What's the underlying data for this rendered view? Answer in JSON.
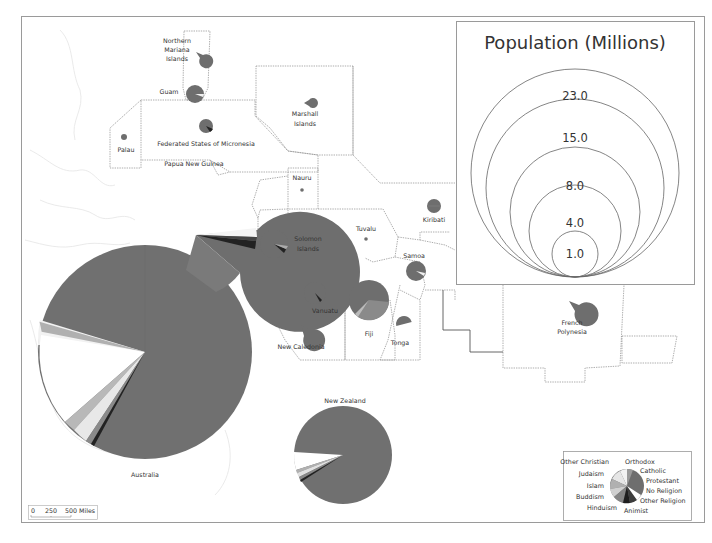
{
  "map": {
    "title": "Population (Millions)",
    "scale_bar": {
      "labels": [
        "0",
        "250",
        "500 Miles"
      ]
    }
  },
  "size_legend": {
    "title": "Population (Millions)",
    "values": [
      "23.0",
      "15.0",
      "8.0",
      "4.0",
      "1.0"
    ]
  },
  "religion_legend": {
    "left_labels": [
      "Other Christian",
      "Judaism",
      "Islam",
      "Buddism",
      "Hinduism"
    ],
    "right_labels": [
      "Orthodox",
      "Catholic",
      "Protestant",
      "No Religion",
      "Other Religion",
      "Animist"
    ]
  },
  "countries": [
    {
      "name": "Northern Mariana Islands",
      "lines": [
        "Northern",
        "Mariana",
        "Islands"
      ]
    },
    {
      "name": "Guam",
      "lines": [
        "Guam"
      ]
    },
    {
      "name": "Palau",
      "lines": [
        "Palau"
      ]
    },
    {
      "name": "Federated States of Micronesia",
      "lines": [
        "Federated States of Micronesia"
      ]
    },
    {
      "name": "Marshall Islands",
      "lines": [
        "Marshall",
        "Islands"
      ]
    },
    {
      "name": "Papua New Guinea",
      "lines": [
        "Papua New Guinea"
      ]
    },
    {
      "name": "Nauru",
      "lines": [
        "Nauru"
      ]
    },
    {
      "name": "Kiribati",
      "lines": [
        "Kiribati"
      ]
    },
    {
      "name": "Solomon Islands",
      "lines": [
        "Solomon",
        "Islands"
      ]
    },
    {
      "name": "Tuvalu",
      "lines": [
        "Tuvalu"
      ]
    },
    {
      "name": "Samoa",
      "lines": [
        "Samoa"
      ]
    },
    {
      "name": "Vanuatu",
      "lines": [
        "Vanuatu"
      ]
    },
    {
      "name": "Fiji",
      "lines": [
        "Fiji"
      ]
    },
    {
      "name": "Tonga",
      "lines": [
        "Tonga"
      ]
    },
    {
      "name": "New Caledonia",
      "lines": [
        "New Caledonia"
      ]
    },
    {
      "name": "French Polynesia",
      "lines": [
        "French",
        "Polynesia"
      ]
    },
    {
      "name": "New Zealand",
      "lines": [
        "New Zealand"
      ]
    },
    {
      "name": "Australia",
      "lines": [
        "Australia"
      ]
    }
  ],
  "colors": {
    "protestant": "#6e6e6e",
    "catholic": "#7b7b7b",
    "orthodox": "#9a9a9a",
    "no_religion": "#ffffff",
    "other_religion": "#3c3c3c",
    "animist": "#1e1e1e",
    "hinduism": "#858585",
    "buddism": "#c8c8c8",
    "islam": "#b0b0b0",
    "judaism": "#e6e6e6",
    "other_christian": "#f0f0f0",
    "frame": "#9a9a9a"
  }
}
